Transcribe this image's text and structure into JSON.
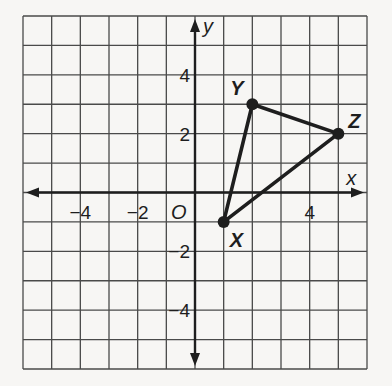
{
  "chart_data": {
    "type": "scatter",
    "title": "",
    "xlabel": "x",
    "ylabel": "y",
    "origin_label": "O",
    "xlim": [
      -6,
      6
    ],
    "ylim": [
      -6,
      6
    ],
    "grid": true,
    "grid_step": 1,
    "x_ticks": [
      {
        "value": -4,
        "label": "−4"
      },
      {
        "value": -2,
        "label": "−2"
      },
      {
        "value": 4,
        "label": "4"
      }
    ],
    "y_ticks": [
      {
        "value": 4,
        "label": "4"
      },
      {
        "value": 2,
        "label": "2"
      },
      {
        "value": -2,
        "label": "−2"
      },
      {
        "value": -4,
        "label": "−4"
      }
    ],
    "points": [
      {
        "name": "X",
        "x": 1,
        "y": -1
      },
      {
        "name": "Y",
        "x": 2,
        "y": 3
      },
      {
        "name": "Z",
        "x": 5,
        "y": 2
      }
    ],
    "polygon": [
      "X",
      "Y",
      "Z"
    ],
    "colors": {
      "ink": "#1e1e1e",
      "grid": "#4a4a4a",
      "background": "#f7f6f4"
    }
  },
  "labels": {
    "x_axis": "x",
    "y_axis": "y",
    "origin": "O",
    "x_tick_neg4": "−4",
    "x_tick_neg2": "−2",
    "x_tick_4": "4",
    "y_tick_4": "4",
    "y_tick_2": "2",
    "y_tick_neg2": "−2",
    "y_tick_neg4": "−4",
    "vertex_x": "X",
    "vertex_y": "Y",
    "vertex_z": "Z"
  }
}
